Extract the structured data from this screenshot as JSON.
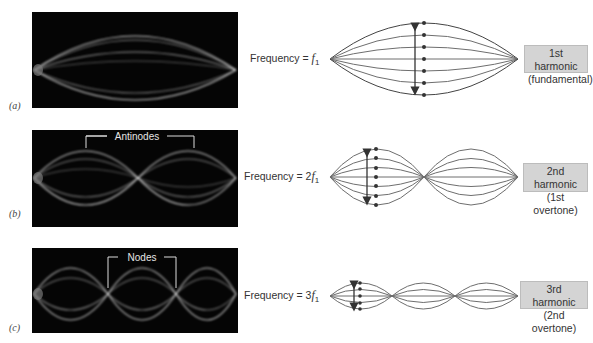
{
  "panels": [
    {
      "id": "a",
      "label": "(a)",
      "frequency_prefix": "Frequency = ",
      "frequency_coef": "",
      "frequency_symbol": "f",
      "frequency_sub": "1",
      "harmonic_line1": "1st harmonic",
      "harmonic_line2": "(fundamental)",
      "loops": 1,
      "photo_annotation": ""
    },
    {
      "id": "b",
      "label": "(b)",
      "frequency_prefix": "Frequency = ",
      "frequency_coef": "2",
      "frequency_symbol": "f",
      "frequency_sub": "1",
      "harmonic_line1": "2nd harmonic",
      "harmonic_line2": "(1st overtone)",
      "loops": 2,
      "photo_annotation": "Antinodes"
    },
    {
      "id": "c",
      "label": "(c)",
      "frequency_prefix": "Frequency = ",
      "frequency_coef": "3",
      "frequency_symbol": "f",
      "frequency_sub": "1",
      "harmonic_line1": "3rd harmonic",
      "harmonic_line2": "(2nd overtone)",
      "loops": 3,
      "photo_annotation": "Nodes"
    }
  ],
  "colors": {
    "photo_bg": "#050505",
    "string_line": "#6e6e6e",
    "string_outer": "#444444",
    "label_box": "#d4d4d4",
    "arrow": "#333333"
  }
}
